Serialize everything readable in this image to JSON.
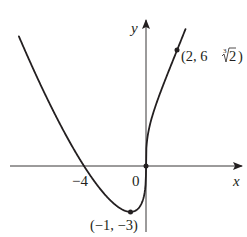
{
  "chart_data": {
    "type": "line",
    "title": "",
    "function": "f(x) = x^(1/3)(x + 4)",
    "xlabel": "x",
    "ylabel": "y",
    "xlim": [
      -8.4,
      6.2
    ],
    "ylim": [
      -4.6,
      9.4
    ],
    "grid": false,
    "legend": null,
    "tick_labels": [
      {
        "axis": "x",
        "value": -4,
        "label": "−4"
      },
      {
        "axis": "origin",
        "value": 0,
        "label": "0"
      }
    ],
    "points": [
      {
        "x": -4,
        "y": 0,
        "label": ""
      },
      {
        "x": 0,
        "y": 0,
        "label": ""
      },
      {
        "x": -1,
        "y": -3,
        "label": "(−1, −3)"
      },
      {
        "x": 2,
        "y": 7.56,
        "label": "(2, 6∛2)"
      }
    ],
    "annotations": [
      "(−1, −3)",
      "(2, 6∛2)"
    ],
    "series": [
      {
        "name": "f(x)",
        "x_range": [
          -8.2,
          2.55
        ],
        "color": "#231f20"
      }
    ]
  },
  "labels": {
    "y_axis": "y",
    "x_axis": "x",
    "tick_neg4": "−4",
    "origin": "0",
    "min_point": "(−1, −3)",
    "pt2_prefix": "(2, 6",
    "pt2_root_index": "3",
    "pt2_radicand": "2",
    "pt2_suffix": ")"
  },
  "colors": {
    "ink": "#231f20",
    "background": "#ffffff"
  }
}
